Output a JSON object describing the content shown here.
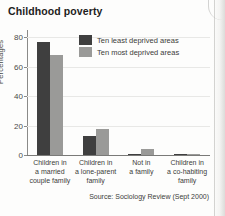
{
  "chart_data": {
    "type": "bar",
    "title": "Childhood poverty",
    "xlabel": "",
    "ylabel": "Percentages",
    "ylim": [
      0,
      85
    ],
    "yticks": [
      0,
      20,
      40,
      60,
      80
    ],
    "ytick_labels": [
      "0",
      "20",
      "40",
      "60",
      "80"
    ],
    "grid": true,
    "legend_position": "top-center",
    "categories": [
      "Children in a married couple family",
      "Children in a lone-parent family",
      "Not in a family",
      "Children in a co-habiting family"
    ],
    "category_lines": [
      [
        "Children in",
        "a married",
        "couple family"
      ],
      [
        "Children in",
        "a lone-parent",
        "family"
      ],
      [
        "Not in",
        "a family"
      ],
      [
        "Children in",
        "a co-habiting",
        "family"
      ]
    ],
    "series": [
      {
        "name": "Ten least deprived areas",
        "color": "#3f3f3f",
        "values": [
          77,
          13,
          1,
          0.5
        ]
      },
      {
        "name": "Ten most deprived areas",
        "color": "#9a9a98",
        "values": [
          68,
          18,
          4,
          0.5
        ]
      }
    ],
    "annotations": [
      "Source: Sociology Review (Sept 2000)"
    ]
  },
  "source_note": "Source: Sociology Review (Sept 2000)"
}
